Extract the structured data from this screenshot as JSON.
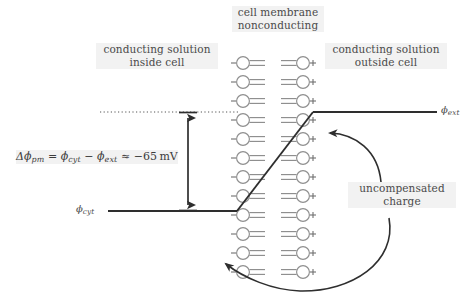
{
  "figure": {
    "title_membrane": "cell membrane\nnonconducting",
    "label_inside": "conducting solution\ninside cell",
    "label_outside": "conducting solution\noutside cell",
    "label_uncompensated": "uncompensated\ncharge",
    "potential_outside": "ϕ",
    "potential_outside_sub": "ext",
    "potential_inside": "ϕ",
    "potential_inside_sub": "cyt",
    "equation": {
      "delta": "Δϕ",
      "delta_sub": "pm",
      "eq": " = ",
      "phi_cyt": "ϕ",
      "phi_cyt_sub": "cyt",
      "minus": " − ",
      "phi_ext": "ϕ",
      "phi_ext_sub": "ext",
      "approx": " ≈ ",
      "value": "−65",
      "unit": "mV",
      "full_text": "Δϕpm = ϕcyt − ϕext ≈ −65 mV"
    },
    "charge_negative": "−",
    "charge_positive": "+",
    "lipid_row_count": 12,
    "colors": {
      "text": "#4a4a4a",
      "lipid": "#8f8f8f",
      "line": "#2e2e2e",
      "label_bg": "#f2f2f2",
      "charge": "#6f6f6f"
    }
  }
}
